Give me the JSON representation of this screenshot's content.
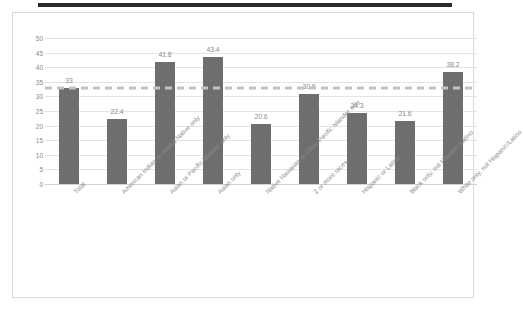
{
  "chart_data": {
    "type": "bar",
    "title": "",
    "xlabel": "",
    "ylabel": "",
    "ylim": [
      0,
      50
    ],
    "ytick_step": 5,
    "yticks": [
      "50",
      "45",
      "40",
      "35",
      "30",
      "25",
      "20",
      "15",
      "10",
      "5",
      "0"
    ],
    "grid": true,
    "legend": false,
    "categories": [
      "Total",
      "American Indian or Alaska Native only",
      "Asian or Pacific Islander only",
      "Asian only",
      "Native Hawaiian or Other Pacific Islander only",
      "2 or more races",
      "Hispanic or Latino",
      "Black only, not Hispanic/Latino",
      "White only, not Hispanic/Latino"
    ],
    "values": [
      33,
      22.4,
      41.8,
      43.4,
      20.6,
      30.9,
      24.3,
      21.6,
      38.2
    ],
    "data_labels": [
      "33",
      "22.4",
      "41.8",
      "43.4",
      "20.6",
      "30.9",
      "24.3",
      "21.6",
      "38.2"
    ],
    "reference_line": {
      "value": 33,
      "style": "dashed",
      "color": "#c2c2c2"
    },
    "bar_color": "#6e6e6e",
    "gridline_color": "#e4e4e4",
    "tick_label_color": "#8a8a8a"
  },
  "decoration": {
    "title_redaction_color": "#2b2b2b",
    "frame_border_color": "#d9d9d9"
  }
}
